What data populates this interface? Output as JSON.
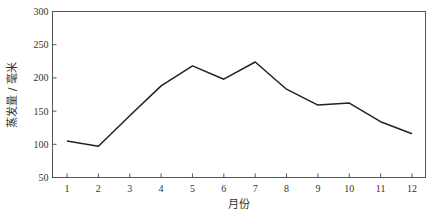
{
  "chart_data": {
    "type": "line",
    "title": "",
    "xlabel": "月份",
    "ylabel": "蒸发量 / 毫米",
    "categories": [
      "1",
      "2",
      "3",
      "4",
      "5",
      "6",
      "7",
      "8",
      "9",
      "10",
      "11",
      "12"
    ],
    "series": [
      {
        "name": "蒸发量",
        "values": [
          105,
          97,
          143,
          188,
          218,
          198,
          224,
          183,
          159,
          162,
          134,
          116
        ],
        "color": "#222222"
      }
    ],
    "ylim": [
      50,
      300
    ],
    "yticks": [
      50,
      100,
      150,
      200,
      250,
      300
    ],
    "grid": false,
    "legend": "none"
  }
}
